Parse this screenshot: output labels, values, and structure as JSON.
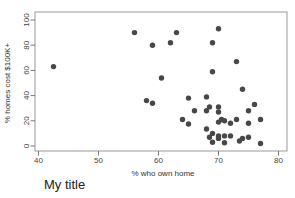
{
  "chart_data": {
    "type": "scatter",
    "title": "My title",
    "xlabel": "% who own home",
    "ylabel": "% homes cost $100K+",
    "xlim": [
      39.4,
      81.5
    ],
    "ylim": [
      -4,
      106.5
    ],
    "xticks": [
      40,
      50,
      60,
      70,
      80
    ],
    "yticks": [
      0,
      20,
      40,
      60,
      80,
      100
    ],
    "grid": false,
    "legend": "none",
    "marker_color": "#474747",
    "frame_color": "#999999",
    "tick_color": "#777777",
    "points": [
      [
        42.5,
        63
      ],
      [
        56,
        90
      ],
      [
        59,
        80
      ],
      [
        63,
        90
      ],
      [
        62,
        82
      ],
      [
        70,
        93
      ],
      [
        69,
        82
      ],
      [
        73,
        67
      ],
      [
        69,
        59
      ],
      [
        60.5,
        54
      ],
      [
        58,
        36
      ],
      [
        59,
        34
      ],
      [
        74,
        45
      ],
      [
        65,
        38
      ],
      [
        68,
        39
      ],
      [
        70,
        31
      ],
      [
        76,
        33
      ],
      [
        66,
        28
      ],
      [
        68,
        28
      ],
      [
        68.5,
        31
      ],
      [
        70,
        27
      ],
      [
        70.5,
        21
      ],
      [
        70,
        19
      ],
      [
        71,
        20
      ],
      [
        72,
        18
      ],
      [
        73,
        21
      ],
      [
        75,
        28
      ],
      [
        77,
        21
      ],
      [
        75,
        18
      ],
      [
        75,
        7
      ],
      [
        77,
        2
      ],
      [
        64,
        21
      ],
      [
        65,
        17.5
      ],
      [
        68,
        13.5
      ],
      [
        69,
        10
      ],
      [
        68.5,
        7
      ],
      [
        70,
        8
      ],
      [
        71,
        8
      ],
      [
        72,
        8
      ],
      [
        70,
        6
      ],
      [
        74,
        6
      ],
      [
        71,
        2.5
      ],
      [
        69,
        3
      ],
      [
        73.5,
        4
      ]
    ]
  }
}
